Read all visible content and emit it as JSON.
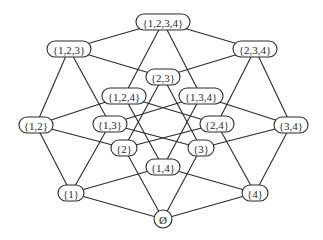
{
  "diagram": {
    "colors": {
      "stroke": "#2a2a2a",
      "fill": "#ffffff",
      "text": "#2a2a2a"
    },
    "nodes": [
      {
        "id": "1234",
        "label": "{1,2,3,4}",
        "x": 163,
        "y": 22,
        "w": 54
      },
      {
        "id": "123",
        "label": "{1,2,3}",
        "x": 69,
        "y": 49,
        "w": 44
      },
      {
        "id": "234",
        "label": "{2,3,4}",
        "x": 255,
        "y": 49,
        "w": 44
      },
      {
        "id": "23",
        "label": "{2,3}",
        "x": 163,
        "y": 77,
        "w": 34
      },
      {
        "id": "124",
        "label": "{1,2,4}",
        "x": 124,
        "y": 96,
        "w": 44
      },
      {
        "id": "134",
        "label": "{1,3,4}",
        "x": 201,
        "y": 96,
        "w": 44
      },
      {
        "id": "12",
        "label": "{1,2}",
        "x": 36,
        "y": 125,
        "w": 34
      },
      {
        "id": "13",
        "label": "{1,3}",
        "x": 110,
        "y": 124,
        "w": 34
      },
      {
        "id": "24",
        "label": "{2,4}",
        "x": 217,
        "y": 124,
        "w": 34
      },
      {
        "id": "34",
        "label": "{3,4}",
        "x": 291,
        "y": 125,
        "w": 34
      },
      {
        "id": "2",
        "label": "{2}",
        "x": 124,
        "y": 148,
        "w": 26
      },
      {
        "id": "3",
        "label": "{3}",
        "x": 201,
        "y": 148,
        "w": 26
      },
      {
        "id": "14",
        "label": "{1,4}",
        "x": 163,
        "y": 167,
        "w": 34
      },
      {
        "id": "1",
        "label": "{1}",
        "x": 71,
        "y": 193,
        "w": 26
      },
      {
        "id": "4",
        "label": "{4}",
        "x": 255,
        "y": 193,
        "w": 26
      },
      {
        "id": "empty",
        "label": "Ø",
        "x": 163,
        "y": 219,
        "w": 18,
        "circle": true
      }
    ],
    "edges": [
      [
        "1234",
        "123"
      ],
      [
        "1234",
        "234"
      ],
      [
        "1234",
        "124"
      ],
      [
        "1234",
        "134"
      ],
      [
        "123",
        "12"
      ],
      [
        "123",
        "13"
      ],
      [
        "123",
        "23"
      ],
      [
        "234",
        "23"
      ],
      [
        "234",
        "24"
      ],
      [
        "234",
        "34"
      ],
      [
        "124",
        "12"
      ],
      [
        "124",
        "14"
      ],
      [
        "124",
        "24"
      ],
      [
        "134",
        "13"
      ],
      [
        "134",
        "14"
      ],
      [
        "134",
        "34"
      ],
      [
        "12",
        "1"
      ],
      [
        "12",
        "2"
      ],
      [
        "13",
        "1"
      ],
      [
        "13",
        "3"
      ],
      [
        "23",
        "2"
      ],
      [
        "23",
        "3"
      ],
      [
        "24",
        "2"
      ],
      [
        "24",
        "4"
      ],
      [
        "34",
        "3"
      ],
      [
        "34",
        "4"
      ],
      [
        "14",
        "1"
      ],
      [
        "14",
        "4"
      ],
      [
        "1",
        "empty"
      ],
      [
        "2",
        "empty"
      ],
      [
        "3",
        "empty"
      ],
      [
        "4",
        "empty"
      ]
    ]
  }
}
